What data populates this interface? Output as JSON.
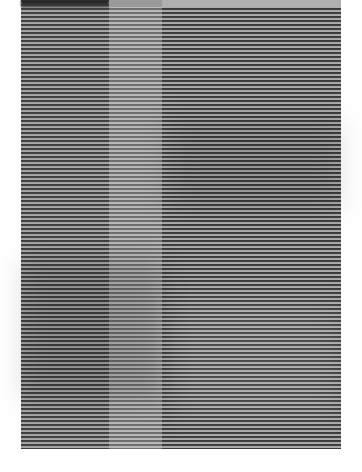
{
  "image": {
    "kind": "photograph",
    "subject": "grayscale horizontal striped pattern in three vertical columns",
    "columns": [
      {
        "name": "left",
        "tone": "dark"
      },
      {
        "name": "middle",
        "tone": "light"
      },
      {
        "name": "right",
        "tone": "dark"
      }
    ],
    "colors": {
      "background": "#ffffff",
      "stripe_dark": "#3c3c3c",
      "stripe_light": "#a8a8a8",
      "middle_dark": "#6a6a6a",
      "middle_light": "#b4b4b4"
    }
  }
}
